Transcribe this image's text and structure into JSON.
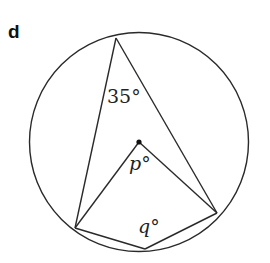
{
  "figure": {
    "part_label": "d",
    "angle_top": "35°",
    "angle_center": "p°",
    "angle_bottom": "q°",
    "stroke_color": "#2a2a2a",
    "background_color": "#ffffff"
  },
  "geometry": {
    "circle": {
      "cx": 139,
      "cy": 142,
      "r": 109.5
    },
    "center_point": {
      "x": 139,
      "y": 142
    },
    "vertices": {
      "top": {
        "x": 116,
        "y": 38
      },
      "left_bottom": {
        "x": 75,
        "y": 228
      },
      "right_bottom": {
        "x": 217,
        "y": 213
      },
      "bottom": {
        "x": 145,
        "y": 249
      }
    },
    "segments": [
      [
        "top",
        "left_bottom"
      ],
      [
        "top",
        "right_bottom"
      ],
      [
        "center_point",
        "left_bottom"
      ],
      [
        "center_point",
        "right_bottom"
      ],
      [
        "left_bottom",
        "bottom"
      ],
      [
        "bottom",
        "right_bottom"
      ]
    ]
  }
}
